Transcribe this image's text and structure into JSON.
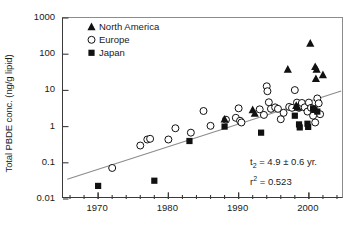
{
  "chart_data": {
    "type": "scatter",
    "title": "",
    "xlabel": "",
    "ylabel": "Total PBDE conc. (ng/g lipid)",
    "xlim": [
      1965,
      2005
    ],
    "ylim": [
      0.01,
      1000
    ],
    "yscale": "log",
    "xticks": [
      1970,
      1980,
      1990,
      2000
    ],
    "xtick_labels": [
      "1970",
      "1980",
      "1990",
      "2000"
    ],
    "xminor_step": 2,
    "yticks": [
      0.01,
      0.1,
      1,
      10,
      100,
      1000
    ],
    "ytick_labels": [
      "0.01",
      "0.1",
      "1",
      "10",
      "100",
      "1000"
    ],
    "grid": false,
    "legend_position": "top-left",
    "series": [
      {
        "name": "North America",
        "marker": "filled-triangle",
        "color": "#111111",
        "points": [
          [
            1988.0,
            1.6
          ],
          [
            1992.0,
            2.9
          ],
          [
            1992.3,
            2.3
          ],
          [
            1997.0,
            38.0
          ],
          [
            1998.2,
            3.8
          ],
          [
            1998.4,
            3.4
          ],
          [
            2000.2,
            200.0
          ],
          [
            2000.9,
            45.0
          ],
          [
            2001.1,
            38.0
          ],
          [
            2001.0,
            21.0
          ],
          [
            2002.0,
            27.0
          ]
        ]
      },
      {
        "name": "Europe",
        "marker": "open-circle",
        "color": "#111111",
        "points": [
          [
            1972.0,
            0.072
          ],
          [
            1976.0,
            0.3
          ],
          [
            1977.0,
            0.44
          ],
          [
            1977.4,
            0.46
          ],
          [
            1980.0,
            0.44
          ],
          [
            1981.0,
            0.9
          ],
          [
            1983.2,
            0.68
          ],
          [
            1985.0,
            2.7
          ],
          [
            1986.0,
            1.05
          ],
          [
            1988.2,
            1.55
          ],
          [
            1989.6,
            1.75
          ],
          [
            1990.0,
            3.2
          ],
          [
            1990.2,
            1.45
          ],
          [
            1990.4,
            1.3
          ],
          [
            1993.0,
            3.0
          ],
          [
            1993.6,
            2.1
          ],
          [
            1994.0,
            13.0
          ],
          [
            1994.1,
            9.5
          ],
          [
            1994.3,
            4.7
          ],
          [
            1994.6,
            3.1
          ],
          [
            1995.2,
            3.4
          ],
          [
            1995.6,
            3.1
          ],
          [
            1996.0,
            1.6
          ],
          [
            1996.4,
            2.4
          ],
          [
            1997.2,
            3.5
          ],
          [
            1997.6,
            3.3
          ],
          [
            1998.0,
            10.2
          ],
          [
            1998.3,
            4.6
          ],
          [
            1998.6,
            3.3
          ],
          [
            1999.0,
            4.5
          ],
          [
            1999.4,
            3.4
          ],
          [
            1999.8,
            2.6
          ],
          [
            2000.0,
            4.6
          ],
          [
            2000.3,
            3.3
          ],
          [
            2000.6,
            2.0
          ],
          [
            2000.9,
            1.3
          ],
          [
            2001.2,
            6.0
          ],
          [
            2001.4,
            4.4
          ],
          [
            2001.6,
            2.2
          ]
        ]
      },
      {
        "name": "Japan",
        "marker": "filled-square",
        "color": "#111111",
        "points": [
          [
            1970.0,
            0.023
          ],
          [
            1978.0,
            0.032
          ],
          [
            1983.0,
            0.4
          ],
          [
            1988.0,
            1.0
          ],
          [
            1993.2,
            0.68
          ],
          [
            1998.0,
            2.0
          ],
          [
            1998.6,
            1.15
          ],
          [
            1998.7,
            0.95
          ],
          [
            1999.8,
            1.2
          ],
          [
            1999.9,
            0.98
          ],
          [
            2000.6,
            3.2
          ],
          [
            2000.8,
            2.9
          ],
          [
            2001.2,
            2.6
          ]
        ]
      }
    ],
    "trendline": {
      "x": [
        1965.6,
        2004.6
      ],
      "y": [
        0.035,
        9.6
      ],
      "color": "#8c8c8c"
    },
    "annotations": {
      "doubling_time": {
        "symbol": "t",
        "subscript": "2",
        "equals": " = 4.9 ",
        "plusminus": "±",
        "error": " 0.6 yr."
      },
      "r_squared": {
        "symbol": "r",
        "superscript": "2",
        "equals": " = 0.523"
      }
    }
  },
  "legend": {
    "items": [
      {
        "label": "North America",
        "marker": "filled-triangle"
      },
      {
        "label": "Europe",
        "marker": "open-circle"
      },
      {
        "label": "Japan",
        "marker": "filled-square"
      }
    ]
  }
}
